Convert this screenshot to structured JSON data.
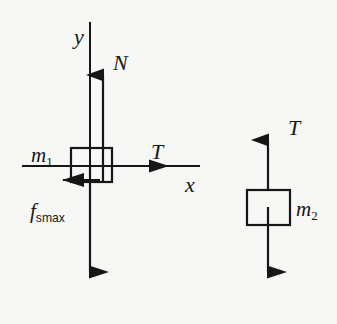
{
  "figure": {
    "background_color": "#f7f7f5",
    "ink_color": "#161616"
  },
  "axes": {
    "y_label": "y",
    "x_label": "x",
    "y_axis": {
      "x": 90,
      "y_top": 22,
      "y_bottom": 248
    },
    "x_axis": {
      "y": 166,
      "x_left": 22,
      "x_right": 200
    }
  },
  "body1": {
    "mass_label": "m",
    "mass_subscript": "1",
    "box": {
      "x": 71,
      "y": 148,
      "width": 41,
      "height": 34
    },
    "forces": [
      {
        "name": "normal-force",
        "label": "N",
        "direction": "up",
        "tail_x": 103,
        "tail_y": 180,
        "tip_y": 57
      },
      {
        "name": "tension-force",
        "label": "T",
        "direction": "right",
        "y": 166,
        "tail_x": 90,
        "tip_x": 168
      },
      {
        "name": "static-friction-force",
        "label": "f",
        "sublabel": "smax",
        "direction": "left",
        "y": 180,
        "tail_x": 100,
        "tip_x": 42
      },
      {
        "name": "weight-force",
        "label": "",
        "direction": "down",
        "x": 90,
        "tail_y": 166,
        "tip_y": 290
      }
    ]
  },
  "body2": {
    "mass_label": "m",
    "mass_subscript": "2",
    "box": {
      "x": 247,
      "y": 190,
      "width": 43,
      "height": 35
    },
    "forces": [
      {
        "name": "tension-force",
        "label": "T",
        "direction": "up",
        "x": 268,
        "tail_y": 208,
        "tip_y": 122
      },
      {
        "name": "weight-force",
        "label": "",
        "direction": "down",
        "x": 268,
        "tail_y": 208,
        "tip_y": 290
      }
    ]
  }
}
